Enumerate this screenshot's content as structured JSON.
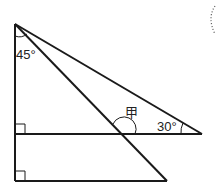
{
  "diagram": {
    "labels": {
      "top_angle": "45°",
      "right_angle": "30°",
      "unknown_angle": "甲"
    },
    "colors": {
      "stroke": "#1a1a1a",
      "background": "#ffffff"
    }
  }
}
